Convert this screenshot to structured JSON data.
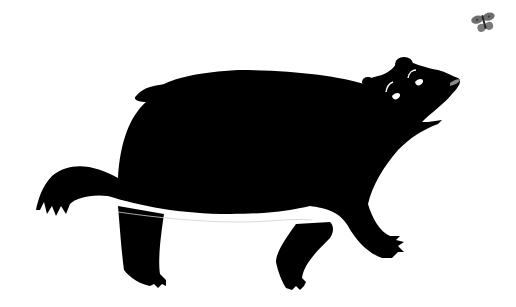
{
  "scene": {
    "description": "Black silhouette illustration of a bear walking and looking up at a butterfly",
    "background": "#ffffff",
    "bear": {
      "label": "bear silhouette",
      "fill": "#000000",
      "nose_highlight": "#8a8a8a",
      "eye_highlight": "#ffffff"
    },
    "butterfly": {
      "label": "butterfly",
      "fill": "#6e6e6e"
    }
  }
}
